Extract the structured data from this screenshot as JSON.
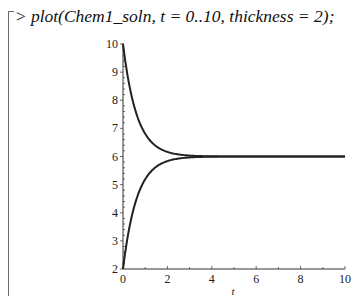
{
  "worksheet": {
    "prompt": ">",
    "command": "plot(Chem1_soln, t = 0..10, thickness = 2);"
  },
  "chart_data": {
    "type": "line",
    "title": "",
    "xlabel": "t",
    "ylabel": "",
    "xlim": [
      0,
      10
    ],
    "ylim": [
      2,
      10
    ],
    "x_ticks": [
      "0",
      "2",
      "4",
      "6",
      "8",
      "10"
    ],
    "y_ticks": [
      "2",
      "3",
      "4",
      "5",
      "6",
      "7",
      "8",
      "9",
      "10"
    ],
    "grid": false,
    "legend": null,
    "series": [
      {
        "name": "decaying solution",
        "x": [
          0,
          0.25,
          0.5,
          0.75,
          1,
          1.5,
          2,
          2.5,
          3,
          4,
          5,
          6,
          8,
          10
        ],
        "y": [
          10,
          8.8,
          7.9,
          7.3,
          6.9,
          6.4,
          6.18,
          6.08,
          6.03,
          6.005,
          6.0,
          6.0,
          6.0,
          6.0
        ]
      },
      {
        "name": "rising solution",
        "x": [
          0,
          0.25,
          0.5,
          0.75,
          1,
          1.5,
          2,
          2.5,
          3,
          4,
          5,
          6,
          8,
          10
        ],
        "y": [
          2,
          3.6,
          4.4,
          5.0,
          5.3,
          5.7,
          5.85,
          5.94,
          5.97,
          5.995,
          6.0,
          6.0,
          6.0,
          6.0
        ]
      }
    ],
    "line_color": "#222222",
    "thickness": 2
  }
}
